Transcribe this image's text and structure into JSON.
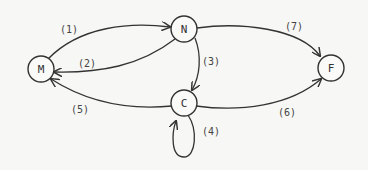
{
  "diagram": {
    "nodes": [
      {
        "id": "M",
        "label": "M",
        "cx": 41,
        "cy": 69
      },
      {
        "id": "N",
        "label": "N",
        "cx": 184,
        "cy": 29
      },
      {
        "id": "C",
        "label": "C",
        "cx": 184,
        "cy": 103
      },
      {
        "id": "F",
        "label": "F",
        "cx": 331,
        "cy": 68
      }
    ],
    "edges": [
      {
        "id": "1",
        "label": "(1)",
        "from": "M",
        "to": "N"
      },
      {
        "id": "2",
        "label": "(2)",
        "from": "N",
        "to": "M"
      },
      {
        "id": "3",
        "label": "(3)",
        "from": "N",
        "to": "C"
      },
      {
        "id": "4",
        "label": "(4)",
        "from": "C",
        "to": "C"
      },
      {
        "id": "5",
        "label": "(5)",
        "from": "C",
        "to": "M"
      },
      {
        "id": "6",
        "label": "(6)",
        "from": "C",
        "to": "F"
      },
      {
        "id": "7",
        "label": "(7)",
        "from": "N",
        "to": "F"
      }
    ]
  }
}
